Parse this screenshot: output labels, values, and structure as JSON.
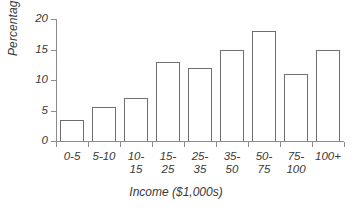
{
  "chart_data": {
    "type": "bar",
    "title": "",
    "xlabel": "Income ($1,000s)",
    "ylabel": "Percentage",
    "categories": [
      "0-5",
      "5-10",
      "10-15",
      "15-25",
      "25-35",
      "35-50",
      "50-75",
      "75-100",
      "100+"
    ],
    "values": [
      3.5,
      5.6,
      7,
      13,
      12,
      15,
      18,
      11,
      15
    ],
    "ylim": [
      0,
      20
    ],
    "yticks": [
      0,
      5,
      10,
      15,
      20
    ],
    "ytick_labels": [
      "0",
      "5",
      "10",
      "15",
      "20"
    ],
    "grid": false,
    "legend": "none",
    "bar_fill_color": "#ffffff",
    "bar_edge_color": "#6f6f6f",
    "axis_color": "#8c8c8c",
    "text_color": "#3a3a3a",
    "background_color": "#ffffff"
  },
  "axis": {
    "y_title": "Percentage",
    "x_title": "Income ($1,000s)"
  },
  "ticks": {
    "y": [
      {
        "label": "20",
        "value": 20
      },
      {
        "label": "15",
        "value": 15
      },
      {
        "label": "10",
        "value": 10
      },
      {
        "label": "5",
        "value": 5
      },
      {
        "label": "0",
        "value": 0
      }
    ]
  },
  "bars": [
    {
      "label": "0-5",
      "label_lines": "0-5",
      "value": 3.5
    },
    {
      "label": "5-10",
      "label_lines": "5-10",
      "value": 5.6
    },
    {
      "label": "10-15",
      "label_lines": "10-\n15",
      "value": 7
    },
    {
      "label": "15-25",
      "label_lines": "15-\n25",
      "value": 13
    },
    {
      "label": "25-35",
      "label_lines": "25-\n35",
      "value": 12
    },
    {
      "label": "35-50",
      "label_lines": "35-\n50",
      "value": 15
    },
    {
      "label": "50-75",
      "label_lines": "50-\n75",
      "value": 18
    },
    {
      "label": "75-100",
      "label_lines": "75-\n100",
      "value": 11
    },
    {
      "label": "100+",
      "label_lines": "100+",
      "value": 15
    }
  ]
}
